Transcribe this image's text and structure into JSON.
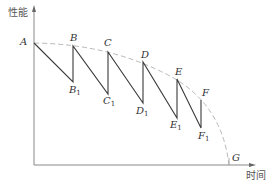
{
  "axes": {
    "y_label": "性能",
    "x_label": "时间"
  },
  "colors": {
    "axis": "#777777",
    "line": "#333333",
    "envelope": "#aaaaaa",
    "text": "#333333"
  },
  "points": {
    "A": {
      "label": "A",
      "x": 34,
      "y": 43
    },
    "B": {
      "label": "B",
      "x": 73,
      "y": 46
    },
    "B1": {
      "label": "B",
      "sub": "1",
      "x": 73,
      "y": 82
    },
    "C": {
      "label": "C",
      "x": 108,
      "y": 52
    },
    "C1": {
      "label": "C",
      "sub": "1",
      "x": 108,
      "y": 94
    },
    "D": {
      "label": "D",
      "x": 143,
      "y": 62
    },
    "D1": {
      "label": "D",
      "sub": "1",
      "x": 143,
      "y": 103
    },
    "E": {
      "label": "E",
      "x": 177,
      "y": 79
    },
    "E1": {
      "label": "E",
      "sub": "1",
      "x": 177,
      "y": 118
    },
    "F": {
      "label": "F",
      "x": 201,
      "y": 100
    },
    "F1": {
      "label": "F",
      "sub": "1",
      "x": 201,
      "y": 128
    },
    "G": {
      "label": "G",
      "x": 229,
      "y": 165
    }
  },
  "labels": {
    "A": "A",
    "B": "B",
    "C": "C",
    "D": "D",
    "E": "E",
    "F": "F",
    "G": "G",
    "sub1": "1"
  }
}
